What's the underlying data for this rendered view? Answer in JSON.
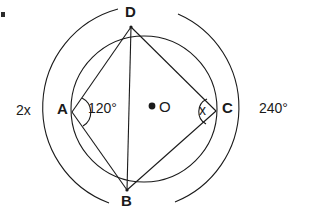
{
  "figure": {
    "type": "geometry-diagram",
    "stroke_color": "#1a1a1a",
    "background_color": "#ffffff",
    "labels": {
      "vertex_d": "D",
      "vertex_a": "A",
      "vertex_b": "B",
      "vertex_c": "C",
      "center_o": "O",
      "angle_a": "120°",
      "angle_c": "x",
      "arc_left": "2x",
      "arc_right": "240°"
    },
    "points": {
      "A": {
        "x": 72,
        "y": 112
      },
      "B": {
        "x": 127,
        "y": 190
      },
      "C": {
        "x": 216,
        "y": 111
      },
      "D": {
        "x": 131,
        "y": 27
      },
      "O": {
        "x": 152,
        "y": 106
      }
    },
    "circle": {
      "cx": 144,
      "cy": 109,
      "r": 73
    },
    "arcs": {
      "left_outer": {
        "cx": 144,
        "cy": 109,
        "r": 102,
        "label": "2x"
      },
      "right_outer": {
        "cx": 144,
        "cy": 109,
        "r": 102,
        "label": "240°"
      }
    },
    "segments": [
      "D-A",
      "D-B",
      "D-C",
      "A-B",
      "B-C"
    ],
    "angle_markers": [
      {
        "at": "A",
        "label": "120°"
      },
      {
        "at": "C",
        "label": "x"
      }
    ]
  }
}
